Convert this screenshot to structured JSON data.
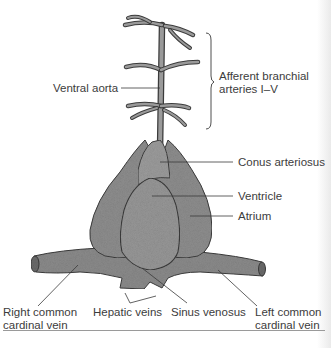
{
  "diagram": {
    "colors": {
      "tissue_fill": "#8f8f8f",
      "tissue_dark": "#6e6e6e",
      "tissue_light": "#a9a9a9",
      "outline": "#3b3b3b",
      "leader_line": "#3a3a3a",
      "text": "#3c3c3c",
      "rule": "#9a9a9a"
    },
    "labels": {
      "ventral_aorta": "Ventral aorta",
      "afferent_line1": "Afferent branchial",
      "afferent_line2": "arteries I–V",
      "conus_arteriosus": "Conus arteriosus",
      "ventricle": "Ventricle",
      "atrium": "Atrium",
      "right_ccv_line1": "Right common",
      "right_ccv_line2": "cardinal vein",
      "hepatic_veins": "Hepatic veins",
      "sinus_venosus": "Sinus venosus",
      "left_ccv_line1": "Left common",
      "left_ccv_line2": "cardinal vein"
    }
  }
}
